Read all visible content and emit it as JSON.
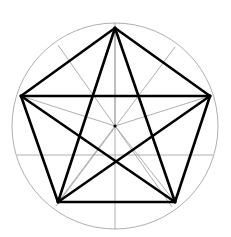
{
  "figure": {
    "canvas": {
      "width": 231,
      "height": 237,
      "background": "#ffffff"
    },
    "colors": {
      "stroke_primary": "#000000",
      "stroke_construction": "#8c8c8c",
      "stroke_circle": "#9a9a9a",
      "background": "#ffffff"
    },
    "geometry": {
      "center": {
        "x": 115,
        "y": 126
      },
      "circle_radius": 103,
      "pentagon_circumradius": 99,
      "rotation_degrees": -90,
      "vertex_count": 5
    },
    "vertices": [
      {
        "name": "top",
        "x": 115,
        "y": 28
      },
      {
        "name": "right",
        "x": 210,
        "y": 96
      },
      {
        "name": "bottom-right",
        "x": 175,
        "y": 202
      },
      {
        "name": "bottom-left",
        "x": 58,
        "y": 202
      },
      {
        "name": "left",
        "x": 21,
        "y": 96
      }
    ],
    "pentagon_edges": [
      {
        "from": "top",
        "to": "right"
      },
      {
        "from": "right",
        "to": "bottom-right"
      },
      {
        "from": "bottom-right",
        "to": "bottom-left"
      },
      {
        "from": "bottom-left",
        "to": "left"
      },
      {
        "from": "left",
        "to": "top"
      }
    ],
    "star_chords": [
      {
        "from": "top",
        "to": "bottom-right"
      },
      {
        "from": "bottom-right",
        "to": "left"
      },
      {
        "from": "left",
        "to": "right"
      },
      {
        "from": "right",
        "to": "bottom-left"
      },
      {
        "from": "bottom-left",
        "to": "top"
      }
    ],
    "construction_lines": [
      {
        "name": "radius-to-top",
        "x1": 115,
        "y1": 126,
        "x2": 115,
        "y2": 28
      },
      {
        "name": "radius-to-right",
        "x1": 115,
        "y1": 126,
        "x2": 210,
        "y2": 96
      },
      {
        "name": "radius-to-bottom-right",
        "x1": 115,
        "y1": 126,
        "x2": 175,
        "y2": 202
      },
      {
        "name": "radius-to-bottom-left",
        "x1": 115,
        "y1": 126,
        "x2": 58,
        "y2": 202
      },
      {
        "name": "radius-to-left",
        "x1": 115,
        "y1": 126,
        "x2": 21,
        "y2": 96
      },
      {
        "name": "vertical-axis",
        "x1": 115,
        "y1": 23,
        "x2": 115,
        "y2": 229
      },
      {
        "name": "diameter-upper-left-to-lower-right",
        "x1": 58,
        "y1": 45,
        "x2": 172,
        "y2": 207
      },
      {
        "name": "diameter-upper-right-to-lower-left",
        "x1": 175,
        "y1": 47,
        "x2": 56,
        "y2": 206
      },
      {
        "name": "diameter-left-to-right-slanted",
        "x1": 17,
        "y1": 155,
        "x2": 213,
        "y2": 155
      },
      {
        "name": "chord-left-vertex-to-right-vertex",
        "x1": 21,
        "y1": 96,
        "x2": 210,
        "y2": 96
      }
    ]
  }
}
